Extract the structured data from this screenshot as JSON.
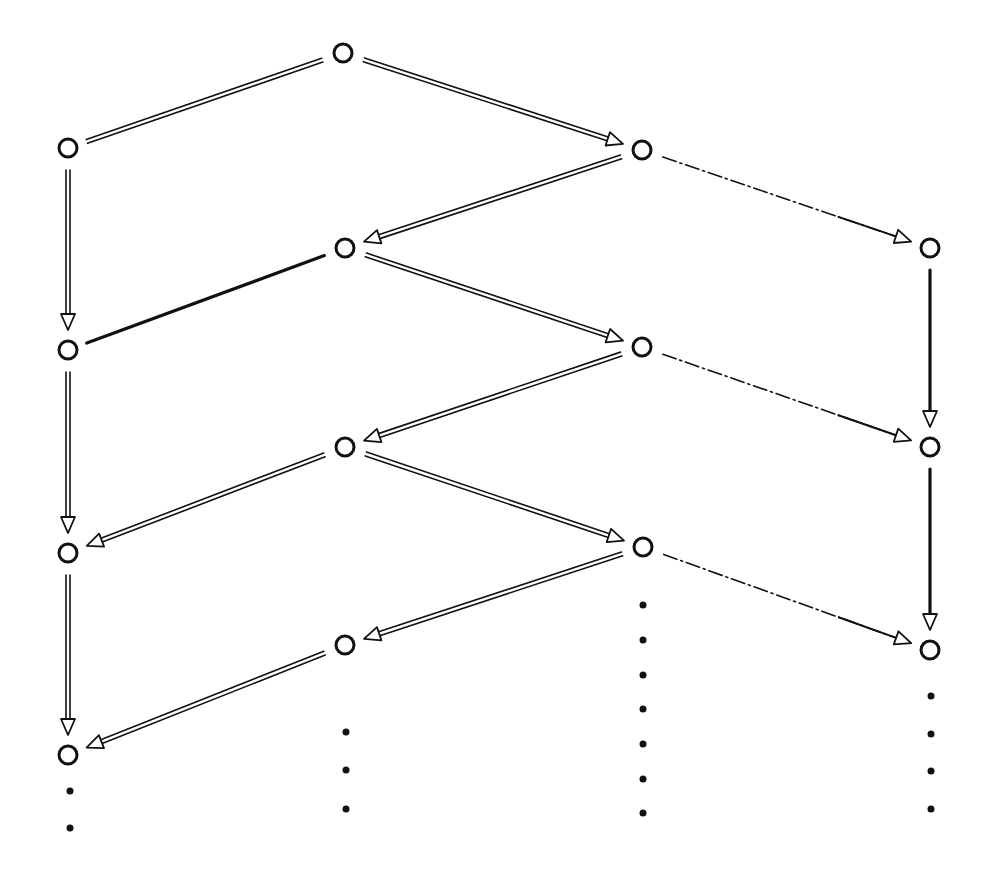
{
  "diagram": {
    "type": "lattice-graph",
    "width": 985,
    "height": 875,
    "colors": {
      "ink": "#111111",
      "background": "#ffffff"
    },
    "node_radius": 9,
    "nodes": [
      {
        "id": "t",
        "x": 343,
        "y": 53
      },
      {
        "id": "a1",
        "x": 68,
        "y": 148
      },
      {
        "id": "c1",
        "x": 642,
        "y": 150
      },
      {
        "id": "b1",
        "x": 345,
        "y": 248
      },
      {
        "id": "d1",
        "x": 930,
        "y": 248
      },
      {
        "id": "a2",
        "x": 68,
        "y": 350
      },
      {
        "id": "c2",
        "x": 642,
        "y": 347
      },
      {
        "id": "b2",
        "x": 345,
        "y": 447
      },
      {
        "id": "d2",
        "x": 930,
        "y": 447
      },
      {
        "id": "a3",
        "x": 68,
        "y": 553
      },
      {
        "id": "c3",
        "x": 643,
        "y": 547
      },
      {
        "id": "b3",
        "x": 345,
        "y": 645
      },
      {
        "id": "d3",
        "x": 930,
        "y": 650
      },
      {
        "id": "a4",
        "x": 68,
        "y": 755
      }
    ],
    "edges": [
      {
        "from": "t",
        "to": "a1",
        "style": "double",
        "arrow": false
      },
      {
        "from": "t",
        "to": "c1",
        "style": "double",
        "arrow": true
      },
      {
        "from": "a1",
        "to": "a2",
        "style": "double",
        "arrow": true
      },
      {
        "from": "c1",
        "to": "b1",
        "style": "double",
        "arrow": true
      },
      {
        "from": "c1",
        "to": "d1",
        "style": "dashdot",
        "arrow": true
      },
      {
        "from": "b1",
        "to": "a2",
        "style": "solid",
        "arrow": false
      },
      {
        "from": "b1",
        "to": "c2",
        "style": "double",
        "arrow": true
      },
      {
        "from": "d1",
        "to": "d2",
        "style": "solid",
        "arrow": true
      },
      {
        "from": "a2",
        "to": "a3",
        "style": "double",
        "arrow": true
      },
      {
        "from": "c2",
        "to": "b2",
        "style": "double",
        "arrow": true
      },
      {
        "from": "c2",
        "to": "d2",
        "style": "dashdot",
        "arrow": true
      },
      {
        "from": "b2",
        "to": "a3",
        "style": "double",
        "arrow": true
      },
      {
        "from": "b2",
        "to": "c3",
        "style": "double",
        "arrow": true
      },
      {
        "from": "d2",
        "to": "d3",
        "style": "solid",
        "arrow": true
      },
      {
        "from": "a3",
        "to": "a4",
        "style": "double",
        "arrow": true
      },
      {
        "from": "c3",
        "to": "b3",
        "style": "double",
        "arrow": true
      },
      {
        "from": "c3",
        "to": "d3",
        "style": "dashdot",
        "arrow": true
      },
      {
        "from": "b3",
        "to": "a4",
        "style": "double",
        "arrow": true
      }
    ],
    "continuation_dots": [
      {
        "column": "a",
        "x": 70,
        "ys": [
          791,
          828
        ]
      },
      {
        "column": "b",
        "x": 346,
        "ys": [
          732,
          770,
          809
        ]
      },
      {
        "column": "c",
        "x": 643,
        "ys": [
          605,
          640,
          675,
          709,
          744,
          779,
          813
        ]
      },
      {
        "column": "d",
        "x": 931,
        "ys": [
          696,
          734,
          771,
          809
        ]
      }
    ]
  }
}
